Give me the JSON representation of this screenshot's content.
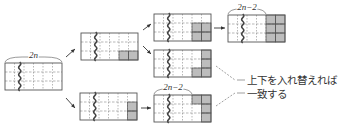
{
  "diagram": {
    "title": "",
    "colors": {
      "line": "#555555",
      "dash": "#888888",
      "shade": "#bdbdbd",
      "text": "#333333"
    },
    "grid": {
      "cols": 6,
      "rows": 3,
      "cell_w": 9.5,
      "cell_h": 9
    },
    "labels": {
      "width_2n": "2n",
      "width_2n_minus_2_top": "2n−2",
      "width_2n_minus_2_bottom": "2n−2",
      "note_line1": "上下を入れ替えれば",
      "note_line2": "一致する"
    },
    "nodes": [
      {
        "id": "start",
        "x": 5,
        "y": 63,
        "shaded": [],
        "brace": "2n"
      },
      {
        "id": "upper-mid",
        "x": 81,
        "y": 33,
        "shaded": [
          [
            2,
            4
          ],
          [
            2,
            5
          ]
        ]
      },
      {
        "id": "lower-mid",
        "x": 80,
        "y": 93,
        "shaded": [
          [
            1,
            5
          ],
          [
            2,
            5
          ]
        ]
      },
      {
        "id": "upper-upper",
        "x": 154,
        "y": 14,
        "shaded": [
          [
            1,
            4
          ],
          [
            1,
            5
          ],
          [
            2,
            4
          ],
          [
            2,
            5
          ]
        ]
      },
      {
        "id": "upper-lower",
        "x": 154,
        "y": 50,
        "shaded": [
          [
            0,
            5
          ],
          [
            1,
            5
          ],
          [
            2,
            4
          ],
          [
            2,
            5
          ]
        ]
      },
      {
        "id": "final-top",
        "x": 228,
        "y": 15,
        "shaded": [
          [
            0,
            4
          ],
          [
            0,
            5
          ],
          [
            1,
            4
          ],
          [
            1,
            5
          ],
          [
            2,
            4
          ],
          [
            2,
            5
          ]
        ],
        "brace": "2n−2"
      },
      {
        "id": "lower-final",
        "x": 154,
        "y": 95,
        "shaded": [
          [
            0,
            4
          ],
          [
            0,
            5
          ],
          [
            1,
            5
          ],
          [
            2,
            5
          ]
        ],
        "brace": "2n−2"
      }
    ]
  }
}
